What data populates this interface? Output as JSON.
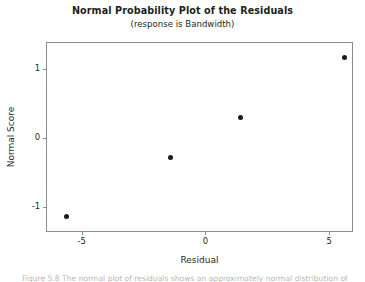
{
  "chart_data": {
    "type": "scatter",
    "title": "Normal Probability Plot of the Residuals",
    "subtitle": "(response is Bandwidth)",
    "xlabel": "Residual",
    "ylabel": "Normal Score",
    "xlim": [
      -6.4,
      6.0
    ],
    "ylim": [
      -1.37,
      1.37
    ],
    "xticks": [
      -5,
      0,
      5
    ],
    "xtick_labels": [
      "-5",
      "0",
      "5"
    ],
    "yticks": [
      -1,
      0,
      1
    ],
    "ytick_labels": [
      "-1",
      "0",
      "1"
    ],
    "grid": false,
    "legend": "none",
    "marker": "filled-circle",
    "marker_color": "#1a1a1a",
    "points": [
      {
        "x": -5.6,
        "y": -1.13
      },
      {
        "x": -1.4,
        "y": -0.28
      },
      {
        "x": 1.4,
        "y": 0.29
      },
      {
        "x": 5.6,
        "y": 1.16
      }
    ],
    "x": [
      -5.6,
      -1.4,
      1.4,
      5.6
    ],
    "values": [
      -1.13,
      -0.28,
      0.29,
      1.16
    ]
  },
  "caption": {
    "text": "Figure 5.8 The normal plot of residuals shows an approximately normal distribution of the residuals."
  },
  "colors": {
    "frame": "#8d8d8d",
    "text": "#231f20",
    "marker": "#1a1a1a",
    "background": "#ffffff"
  }
}
